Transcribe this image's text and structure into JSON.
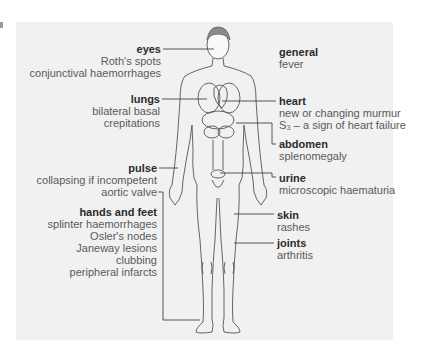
{
  "figure": {
    "panel_color": "#f1f1f1",
    "line_color": "#444444",
    "body_outline_color": "#555555"
  },
  "callouts": {
    "eyes": {
      "title": "eyes",
      "lines": [
        "Roth's spots",
        "conjunctival haemorrhages"
      ]
    },
    "lungs": {
      "title": "lungs",
      "lines": [
        "bilateral basal",
        "crepitations"
      ]
    },
    "pulse": {
      "title": "pulse",
      "lines": [
        "collapsing if incompetent",
        "aortic valve"
      ]
    },
    "hands_feet": {
      "title": "hands and feet",
      "lines": [
        "splinter haemorrhages",
        "Osler's nodes",
        "Janeway lesions",
        "clubbing",
        "peripheral infarcts"
      ]
    },
    "general": {
      "title": "general",
      "lines": [
        "fever"
      ]
    },
    "heart": {
      "title": "heart",
      "lines": [
        "new or changing murmur",
        "S₃ – a sign of heart failure"
      ]
    },
    "abdomen": {
      "title": "abdomen",
      "lines": [
        "splenomegaly"
      ]
    },
    "urine": {
      "title": "urine",
      "lines": [
        "microscopic haematuria"
      ]
    },
    "skin": {
      "title": "skin",
      "lines": [
        "rashes"
      ]
    },
    "joints": {
      "title": "joints",
      "lines": [
        "arthritis"
      ]
    }
  }
}
